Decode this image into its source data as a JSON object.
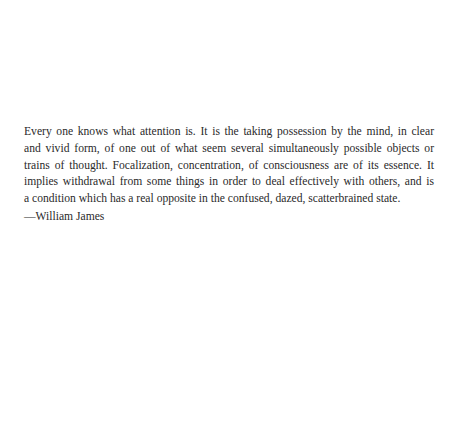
{
  "quote": {
    "lines": [
      "Every one knows what attention is. It is the taking possession by the mind, in clear",
      "and vivid form, of one out of what seem several simultaneously possible objects or",
      "trains of thought. Focalization, concentration, of consciousness are of its essence. It",
      "implies withdrawal from some things in order to deal effectively with others, and is",
      "a condition which has a real opposite in the confused, dazed, scatterbrained state."
    ],
    "attribution": "—William James"
  }
}
